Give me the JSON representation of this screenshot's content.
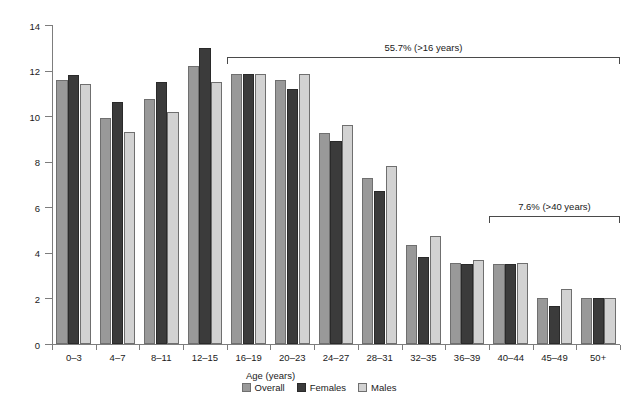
{
  "chart_data": {
    "type": "bar",
    "title": "",
    "xlabel": "Age (years)",
    "ylabel": "Proportion (%)",
    "ylim": [
      0,
      14
    ],
    "yticks": [
      0,
      2,
      4,
      6,
      8,
      10,
      12,
      14
    ],
    "ytick_labels": [
      "0",
      "2",
      "4",
      "6",
      "8",
      "10",
      "12",
      "14"
    ],
    "grid": false,
    "legend_position": "bottom-center",
    "categories": [
      "0–3",
      "4–7",
      "8–11",
      "12–15",
      "16–19",
      "20–23",
      "24–27",
      "28–31",
      "32–35",
      "36–39",
      "40–44",
      "45–49",
      "50+"
    ],
    "series": [
      {
        "name": "Overall",
        "color": "#999999",
        "values": [
          11.6,
          9.9,
          10.75,
          12.2,
          11.85,
          11.6,
          9.25,
          7.3,
          4.35,
          3.55,
          3.5,
          2.0,
          2.0
        ]
      },
      {
        "name": "Females",
        "color": "#3b3b3b",
        "values": [
          11.8,
          10.6,
          11.5,
          13.0,
          11.85,
          11.2,
          8.9,
          6.7,
          3.8,
          3.5,
          3.5,
          1.65,
          2.0
        ]
      },
      {
        "name": "Males",
        "color": "#d2d2d2",
        "values": [
          11.4,
          9.3,
          10.2,
          11.5,
          11.85,
          11.85,
          9.6,
          7.8,
          4.75,
          3.7,
          3.55,
          2.4,
          2.0
        ]
      }
    ],
    "annotations": [
      {
        "label": "55.7% (>16 years)",
        "start_category": "16–19",
        "end_category": "50+",
        "y_value": 12.6
      },
      {
        "label": "7.6% (>40 years)",
        "start_category": "40–44",
        "end_category": "50+",
        "y_value": 5.6
      }
    ]
  },
  "legend": {
    "items": [
      {
        "label": "Overall",
        "key": "overall"
      },
      {
        "label": "Females",
        "key": "females"
      },
      {
        "label": "Males",
        "key": "males"
      }
    ]
  }
}
